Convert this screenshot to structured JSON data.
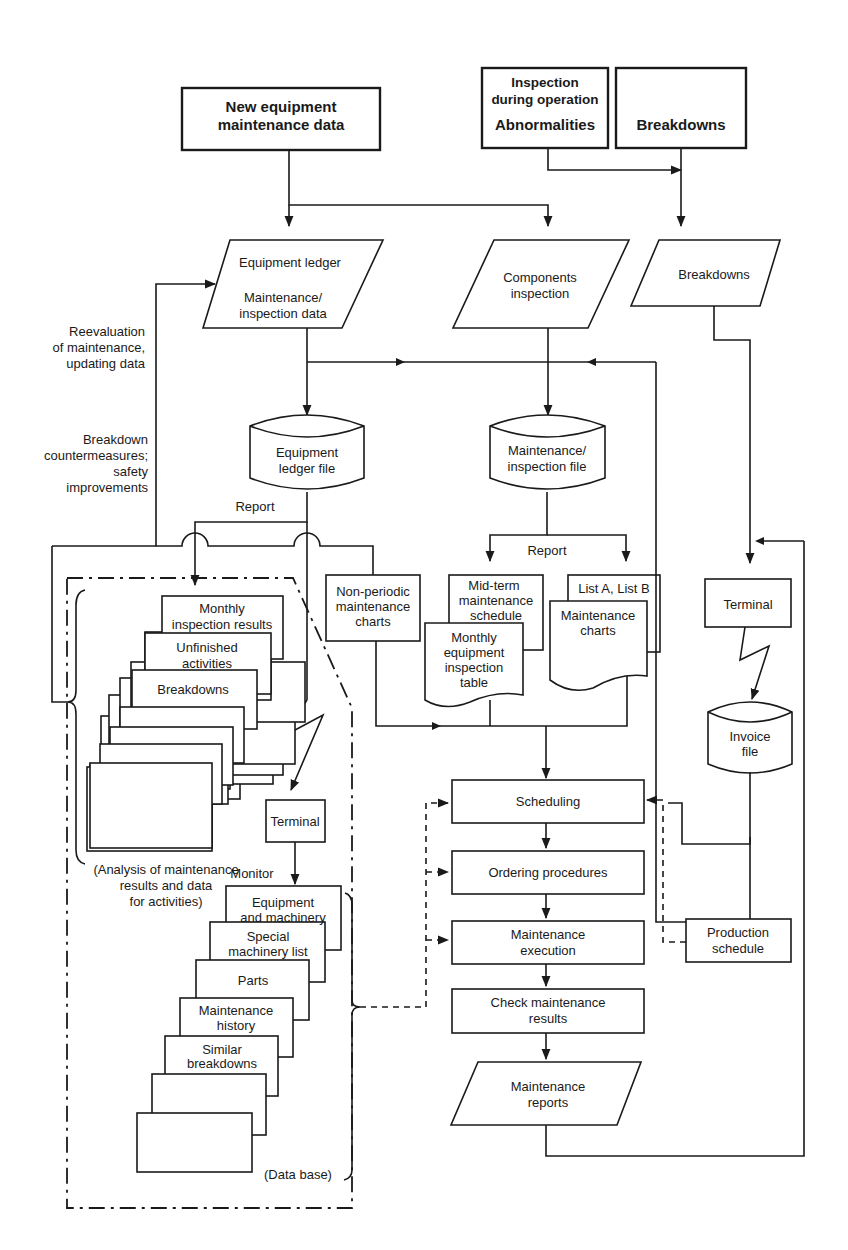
{
  "inputs": {
    "new_equipment": [
      "New equipment",
      "maintenance data"
    ],
    "inspection": [
      "Inspection",
      "during operation"
    ],
    "abnormalities": "Abnormalities",
    "breakdowns_top": "Breakdowns"
  },
  "data_entry": {
    "equipment_ledger": [
      "Equipment ledger",
      "Maintenance/",
      "inspection data"
    ],
    "components_inspection": [
      "Components",
      "inspection"
    ],
    "breakdowns": "Breakdowns"
  },
  "files": {
    "equipment_ledger_file": [
      "Equipment",
      "ledger file"
    ],
    "maintenance_inspection_file": [
      "Maintenance/",
      "inspection file"
    ],
    "invoice_file": [
      "Invoice",
      "file"
    ]
  },
  "labels": {
    "reevaluation": [
      "Reevaluation",
      "of maintenance,",
      "updating data"
    ],
    "breakdown_countermeasures": [
      "Breakdown",
      "countermeasures;",
      "safety",
      "improvements"
    ],
    "report_left": "Report",
    "report_mid": "Report",
    "monitor": "Monitor",
    "analysis_note": [
      "(Analysis of maintenance",
      "results and data",
      "for activities)"
    ],
    "database_note": "(Data base)"
  },
  "analysis_stack": [
    "Monthly|inspection results",
    "Unfinished|activities",
    "Breakdowns"
  ],
  "database_stack": [
    "Equipment|and machinery",
    "Special|machinery list",
    "Parts",
    "Maintenance|history",
    "Similar|breakdowns"
  ],
  "documents": {
    "non_periodic": [
      "Non-periodic",
      "maintenance",
      "charts"
    ],
    "mid_term": [
      "Mid-term",
      "maintenance",
      "schedule"
    ],
    "monthly_table": [
      "Monthly",
      "equipment",
      "inspection",
      "table"
    ],
    "list_ab": "List A, List B",
    "maintenance_charts": [
      "Maintenance",
      "charts"
    ]
  },
  "terminals": {
    "left": "Terminal",
    "right": "Terminal"
  },
  "process": {
    "scheduling": "Scheduling",
    "ordering": "Ordering procedures",
    "execution": [
      "Maintenance",
      "execution"
    ],
    "check": [
      "Check maintenance",
      "results"
    ],
    "reports": [
      "Maintenance",
      "reports"
    ],
    "production_schedule": [
      "Production",
      "schedule"
    ]
  }
}
